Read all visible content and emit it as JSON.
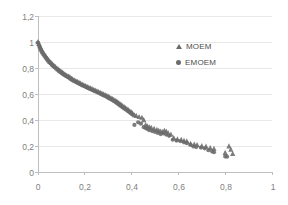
{
  "chart_data": {
    "type": "scatter",
    "title": "",
    "subtitle": "",
    "xlabel": "",
    "ylabel": "",
    "xlim": [
      0,
      1
    ],
    "ylim": [
      0,
      1.2
    ],
    "grid": true,
    "grid_axis": "y",
    "legend_position": "inside-top-right",
    "decimal_separator": ",",
    "x_ticks": [
      0,
      0.2,
      0.4,
      0.6,
      0.8,
      1
    ],
    "x_tick_labels": [
      "0",
      "0,2",
      "0,4",
      "0,6",
      "0,8",
      "1"
    ],
    "y_ticks": [
      0,
      0.2,
      0.4,
      0.6,
      0.8,
      1,
      1.2
    ],
    "y_tick_labels": [
      "0",
      "0,2",
      "0,4",
      "0,6",
      "0,8",
      "1",
      "1,2"
    ],
    "marker_color": "#6b6b6b",
    "axis_color": "#bfbfbf",
    "grid_color": "#e8e8e8",
    "tick_text_color": "#808080",
    "series": [
      {
        "name": "MOEM",
        "marker": "triangle",
        "color": "#6b6b6b",
        "points": [
          [
            0.0,
            1.0
          ],
          [
            0.004,
            0.985
          ],
          [
            0.008,
            0.968
          ],
          [
            0.012,
            0.952
          ],
          [
            0.016,
            0.938
          ],
          [
            0.02,
            0.924
          ],
          [
            0.025,
            0.91
          ],
          [
            0.03,
            0.897
          ],
          [
            0.035,
            0.884
          ],
          [
            0.04,
            0.872
          ],
          [
            0.045,
            0.861
          ],
          [
            0.05,
            0.85
          ],
          [
            0.056,
            0.839
          ],
          [
            0.062,
            0.828
          ],
          [
            0.068,
            0.818
          ],
          [
            0.074,
            0.808
          ],
          [
            0.08,
            0.799
          ],
          [
            0.086,
            0.79
          ],
          [
            0.092,
            0.781
          ],
          [
            0.098,
            0.773
          ],
          [
            0.104,
            0.765
          ],
          [
            0.11,
            0.757
          ],
          [
            0.116,
            0.749
          ],
          [
            0.123,
            0.742
          ],
          [
            0.13,
            0.735
          ],
          [
            0.136,
            0.73
          ],
          [
            0.142,
            0.72
          ],
          [
            0.148,
            0.713
          ],
          [
            0.155,
            0.706
          ],
          [
            0.162,
            0.7
          ],
          [
            0.168,
            0.694
          ],
          [
            0.175,
            0.688
          ],
          [
            0.182,
            0.681
          ],
          [
            0.189,
            0.674
          ],
          [
            0.196,
            0.668
          ],
          [
            0.203,
            0.662
          ],
          [
            0.21,
            0.656
          ],
          [
            0.217,
            0.65
          ],
          [
            0.224,
            0.645
          ],
          [
            0.231,
            0.639
          ],
          [
            0.238,
            0.633
          ],
          [
            0.245,
            0.627
          ],
          [
            0.252,
            0.622
          ],
          [
            0.259,
            0.616
          ],
          [
            0.266,
            0.61
          ],
          [
            0.273,
            0.604
          ],
          [
            0.28,
            0.598
          ],
          [
            0.287,
            0.592
          ],
          [
            0.294,
            0.586
          ],
          [
            0.3,
            0.58
          ],
          [
            0.306,
            0.574
          ],
          [
            0.312,
            0.568
          ],
          [
            0.318,
            0.562
          ],
          [
            0.324,
            0.556
          ],
          [
            0.33,
            0.549
          ],
          [
            0.336,
            0.543
          ],
          [
            0.341,
            0.536
          ],
          [
            0.346,
            0.529
          ],
          [
            0.351,
            0.522
          ],
          [
            0.356,
            0.515
          ],
          [
            0.362,
            0.507
          ],
          [
            0.368,
            0.5
          ],
          [
            0.374,
            0.492
          ],
          [
            0.38,
            0.484
          ],
          [
            0.386,
            0.477
          ],
          [
            0.392,
            0.468
          ],
          [
            0.398,
            0.461
          ],
          [
            0.404,
            0.452
          ],
          [
            0.412,
            0.437
          ],
          [
            0.42,
            0.432
          ],
          [
            0.432,
            0.424
          ],
          [
            0.444,
            0.418
          ],
          [
            0.452,
            0.4
          ],
          [
            0.46,
            0.362
          ],
          [
            0.468,
            0.352
          ],
          [
            0.476,
            0.345
          ],
          [
            0.484,
            0.34
          ],
          [
            0.496,
            0.332
          ],
          [
            0.508,
            0.325
          ],
          [
            0.516,
            0.318
          ],
          [
            0.524,
            0.312
          ],
          [
            0.532,
            0.308
          ],
          [
            0.54,
            0.318
          ],
          [
            0.548,
            0.312
          ],
          [
            0.556,
            0.3
          ],
          [
            0.568,
            0.288
          ],
          [
            0.58,
            0.262
          ],
          [
            0.596,
            0.252
          ],
          [
            0.612,
            0.248
          ],
          [
            0.624,
            0.24
          ],
          [
            0.636,
            0.236
          ],
          [
            0.652,
            0.218
          ],
          [
            0.668,
            0.212
          ],
          [
            0.68,
            0.208
          ],
          [
            0.7,
            0.2
          ],
          [
            0.718,
            0.196
          ],
          [
            0.736,
            0.185
          ],
          [
            0.752,
            0.178
          ],
          [
            0.8,
            0.148
          ],
          [
            0.816,
            0.198
          ],
          [
            0.824,
            0.172
          ],
          [
            0.832,
            0.14
          ]
        ]
      },
      {
        "name": "EMOEM",
        "marker": "circle",
        "color": "#6b6b6b",
        "points": [
          [
            0.0,
            0.996
          ],
          [
            0.004,
            0.975
          ],
          [
            0.008,
            0.958
          ],
          [
            0.012,
            0.942
          ],
          [
            0.016,
            0.928
          ],
          [
            0.02,
            0.914
          ],
          [
            0.025,
            0.9
          ],
          [
            0.03,
            0.888
          ],
          [
            0.035,
            0.876
          ],
          [
            0.04,
            0.864
          ],
          [
            0.045,
            0.853
          ],
          [
            0.05,
            0.843
          ],
          [
            0.056,
            0.832
          ],
          [
            0.062,
            0.822
          ],
          [
            0.068,
            0.812
          ],
          [
            0.074,
            0.802
          ],
          [
            0.08,
            0.793
          ],
          [
            0.086,
            0.784
          ],
          [
            0.092,
            0.776
          ],
          [
            0.098,
            0.767
          ],
          [
            0.104,
            0.759
          ],
          [
            0.11,
            0.751
          ],
          [
            0.116,
            0.744
          ],
          [
            0.123,
            0.736
          ],
          [
            0.13,
            0.728
          ],
          [
            0.136,
            0.721
          ],
          [
            0.142,
            0.714
          ],
          [
            0.148,
            0.707
          ],
          [
            0.155,
            0.7
          ],
          [
            0.162,
            0.694
          ],
          [
            0.168,
            0.687
          ],
          [
            0.175,
            0.681
          ],
          [
            0.182,
            0.675
          ],
          [
            0.189,
            0.668
          ],
          [
            0.196,
            0.662
          ],
          [
            0.203,
            0.656
          ],
          [
            0.21,
            0.65
          ],
          [
            0.217,
            0.644
          ],
          [
            0.224,
            0.638
          ],
          [
            0.231,
            0.632
          ],
          [
            0.238,
            0.626
          ],
          [
            0.245,
            0.621
          ],
          [
            0.252,
            0.615
          ],
          [
            0.259,
            0.609
          ],
          [
            0.266,
            0.603
          ],
          [
            0.273,
            0.597
          ],
          [
            0.28,
            0.591
          ],
          [
            0.287,
            0.585
          ],
          [
            0.294,
            0.578
          ],
          [
            0.3,
            0.572
          ],
          [
            0.306,
            0.566
          ],
          [
            0.312,
            0.56
          ],
          [
            0.318,
            0.553
          ],
          [
            0.324,
            0.547
          ],
          [
            0.33,
            0.54
          ],
          [
            0.336,
            0.533
          ],
          [
            0.341,
            0.527
          ],
          [
            0.346,
            0.52
          ],
          [
            0.351,
            0.513
          ],
          [
            0.356,
            0.506
          ],
          [
            0.362,
            0.498
          ],
          [
            0.368,
            0.491
          ],
          [
            0.374,
            0.483
          ],
          [
            0.38,
            0.476
          ],
          [
            0.386,
            0.468
          ],
          [
            0.392,
            0.459
          ],
          [
            0.398,
            0.451
          ],
          [
            0.404,
            0.442
          ],
          [
            0.412,
            0.362
          ],
          [
            0.428,
            0.382
          ],
          [
            0.44,
            0.372
          ],
          [
            0.452,
            0.345
          ],
          [
            0.46,
            0.338
          ],
          [
            0.468,
            0.33
          ],
          [
            0.476,
            0.322
          ],
          [
            0.488,
            0.315
          ],
          [
            0.5,
            0.308
          ],
          [
            0.512,
            0.3
          ],
          [
            0.524,
            0.292
          ],
          [
            0.536,
            0.296
          ],
          [
            0.548,
            0.288
          ],
          [
            0.56,
            0.278
          ],
          [
            0.576,
            0.248
          ],
          [
            0.592,
            0.242
          ],
          [
            0.608,
            0.238
          ],
          [
            0.624,
            0.228
          ],
          [
            0.636,
            0.222
          ],
          [
            0.652,
            0.208
          ],
          [
            0.664,
            0.196
          ],
          [
            0.676,
            0.192
          ],
          [
            0.696,
            0.188
          ],
          [
            0.712,
            0.182
          ],
          [
            0.728,
            0.168
          ],
          [
            0.744,
            0.158
          ],
          [
            0.752,
            0.152
          ],
          [
            0.8,
            0.12
          ],
          [
            0.808,
            0.118
          ]
        ]
      }
    ]
  },
  "legend": {
    "entries": [
      {
        "label": "MOEM",
        "marker": "triangle-marker-icon"
      },
      {
        "label": "EMOEM",
        "marker": "circle-marker-icon"
      }
    ]
  },
  "axes": {
    "y_labels": [
      "1,2",
      "1",
      "0,8",
      "0,6",
      "0,4",
      "0,2",
      "0"
    ],
    "x_labels": [
      "0",
      "0,2",
      "0,4",
      "0,6",
      "0,8",
      "1"
    ]
  }
}
